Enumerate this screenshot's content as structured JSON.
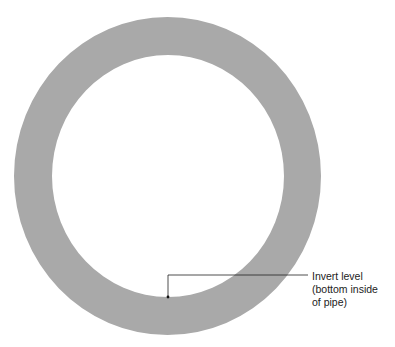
{
  "diagram": {
    "type": "pipe-cross-section",
    "colors": {
      "pipe_wall": "#a9a9a9",
      "background": "#ffffff",
      "line": "#222222"
    },
    "annotation": {
      "lines": [
        "Invert level",
        "(bottom inside",
        "of pipe)"
      ]
    }
  }
}
